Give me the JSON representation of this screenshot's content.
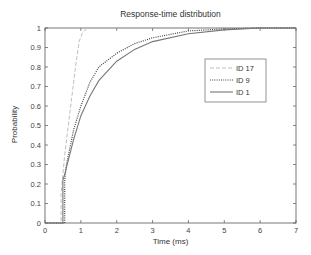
{
  "chart_data": {
    "type": "line",
    "title": "Response-time distribution",
    "xlabel": "Time (ms)",
    "ylabel": "Probability",
    "xlim": [
      0,
      7
    ],
    "ylim": [
      0,
      1
    ],
    "xticks": [
      0,
      1,
      2,
      3,
      4,
      5,
      6,
      7
    ],
    "yticks": [
      0,
      0.1,
      0.2,
      0.3,
      0.4,
      0.5,
      0.6,
      0.7,
      0.8,
      0.9,
      1
    ],
    "grid": false,
    "legend_position": "upper right (inside)",
    "series": [
      {
        "name": "ID 17",
        "style": "dashed",
        "color": "#b8b8b8",
        "x": [
          0,
          0.45,
          0.45,
          0.55,
          0.65,
          0.75,
          0.85,
          0.95,
          1.05,
          1.2,
          1.4,
          7
        ],
        "y": [
          0,
          0,
          0.15,
          0.35,
          0.5,
          0.65,
          0.8,
          0.93,
          0.98,
          1.0,
          1.0,
          1.0
        ]
      },
      {
        "name": "ID 9",
        "style": "dotted",
        "color": "#444444",
        "x": [
          0,
          0.55,
          0.55,
          0.6,
          0.8,
          1.0,
          1.25,
          1.5,
          2.0,
          2.5,
          3.0,
          4.0,
          5.0,
          6.0,
          7
        ],
        "y": [
          0,
          0,
          0.22,
          0.3,
          0.48,
          0.6,
          0.72,
          0.8,
          0.87,
          0.92,
          0.95,
          0.985,
          0.995,
          1.0,
          1.0
        ]
      },
      {
        "name": "ID 1",
        "style": "solid",
        "color": "#777777",
        "x": [
          0,
          0.5,
          0.5,
          0.55,
          0.8,
          1.0,
          1.25,
          1.5,
          2.0,
          2.5,
          3.0,
          4.0,
          5.0,
          6.0,
          7
        ],
        "y": [
          0,
          0,
          0.22,
          0.25,
          0.43,
          0.55,
          0.65,
          0.73,
          0.83,
          0.89,
          0.93,
          0.97,
          0.99,
          1.0,
          1.0
        ]
      }
    ]
  }
}
